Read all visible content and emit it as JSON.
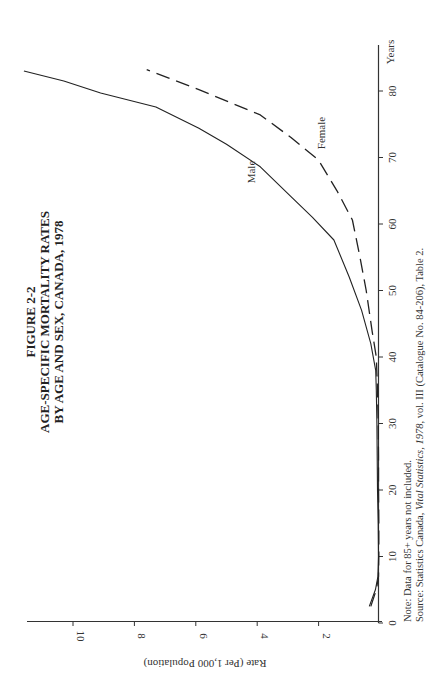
{
  "figure": {
    "number": "FIGURE 2-2",
    "title_line1": "AGE-SPECIFIC MORTALITY RATES",
    "title_line2": "BY AGE AND SEX, CANADA, 1978"
  },
  "notes": {
    "note": "Note: Data for 85+ years not included.",
    "source_prefix": "Source: Statistics Canada, ",
    "source_italic": "Vital Statistics, 1978",
    "source_suffix": ", vol. III (Catalogue No. 84-206), Table 2."
  },
  "chart_data": {
    "type": "line",
    "orientation": "rotated 90° counter-clockwise (age axis vertical on right, rate axis horizontal at bottom)",
    "title": "AGE-SPECIFIC MORTALITY RATES BY AGE AND SEX, CANADA, 1978",
    "xlabel": "Years",
    "ylabel": "Rate (Per 1,000 Population)",
    "xlim": [
      0,
      85
    ],
    "ylim": [
      0,
      11.5
    ],
    "x_ticks": [
      0,
      10,
      20,
      30,
      40,
      50,
      60,
      70,
      80
    ],
    "y_ticks": [
      2,
      4,
      6,
      8,
      10
    ],
    "grid": false,
    "legend": "inline labels on curves",
    "series": [
      {
        "name": "Male",
        "style": "solid",
        "x": [
          2.5,
          5,
          7,
          10,
          15,
          20,
          25,
          30,
          35,
          38,
          42,
          47,
          52,
          57.6,
          61,
          64.1,
          68.6,
          72,
          74.4,
          77.6,
          79.7,
          81.5,
          83
        ],
        "y": [
          0.35,
          0.15,
          0.07,
          0.05,
          0.06,
          0.08,
          0.09,
          0.1,
          0.12,
          0.14,
          0.3,
          0.6,
          1.0,
          1.5,
          2.2,
          2.9,
          3.9,
          5.0,
          5.9,
          7.3,
          9.1,
          10.3,
          11.6
        ]
      },
      {
        "name": "Female",
        "style": "dashed",
        "x": [
          2.5,
          5,
          7,
          10,
          15,
          20,
          25,
          30,
          35,
          40,
          44,
          50,
          55,
          60.6,
          65,
          69.6,
          73,
          76.4,
          80.2,
          83.2
        ],
        "y": [
          0.3,
          0.12,
          0.05,
          0.04,
          0.04,
          0.05,
          0.05,
          0.06,
          0.08,
          0.12,
          0.26,
          0.45,
          0.65,
          0.9,
          1.4,
          2.0,
          2.9,
          3.9,
          5.9,
          7.6
        ]
      }
    ],
    "annotations": [
      "Male",
      "Female"
    ]
  },
  "axis": {
    "x_title": "Years",
    "y_title": "Rate (Per 1,000 Population)",
    "x_ticks": [
      "0",
      "10",
      "20",
      "30",
      "40",
      "50",
      "60",
      "70",
      "80"
    ],
    "y_ticks": [
      "2",
      "4",
      "6",
      "8",
      "10"
    ]
  },
  "colors": {
    "ink": "#222222",
    "axis": "#333333",
    "background": "#ffffff"
  }
}
